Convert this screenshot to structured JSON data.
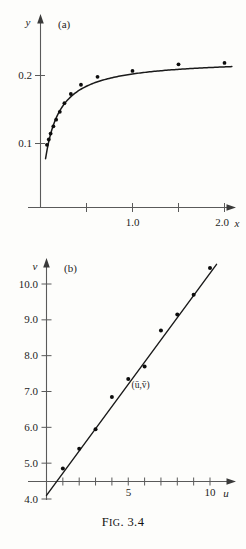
{
  "figure": {
    "caption_prefix": "F",
    "caption_smallcaps": "IG",
    "caption_rest": ". 3.4"
  },
  "panel_a": {
    "label": "(a)",
    "x_axis_label": "x",
    "y_axis_label": "y",
    "x_tick_labels": [
      "1.0",
      "2.0"
    ],
    "y_tick_labels": [
      "0.1",
      "0.2"
    ]
  },
  "panel_b": {
    "label": "(b)",
    "x_axis_label": "u",
    "y_axis_label": "v",
    "x_tick_labels": [
      "5",
      "10"
    ],
    "y_tick_labels": [
      "4.0",
      "5.0",
      "6.0",
      "7.0",
      "8.0",
      "9.0",
      "10.0"
    ],
    "annotation": "(ū,̄v̄)",
    "annotation_text": "(ū,v̄)"
  },
  "chart_data": [
    {
      "type": "scatter",
      "title": "(a)",
      "xlabel": "x",
      "ylabel": "y",
      "xlim": [
        0,
        2.15
      ],
      "ylim": [
        0,
        0.245
      ],
      "x_ticks": [
        0.5,
        1.0,
        1.5,
        2.0
      ],
      "x_ticks_labeled": [
        1.0,
        2.0
      ],
      "y_ticks": [
        0.1,
        0.2
      ],
      "grid": false,
      "legend": "none",
      "x": [
        0.07,
        0.09,
        0.11,
        0.14,
        0.17,
        0.21,
        0.26,
        0.33,
        0.44,
        0.62,
        1.0,
        1.5,
        2.0
      ],
      "y": [
        0.095,
        0.103,
        0.112,
        0.123,
        0.133,
        0.145,
        0.158,
        0.172,
        0.186,
        0.198,
        0.207,
        0.217,
        0.219
      ],
      "fit_curve": {
        "model": "saturation",
        "description": "y = x / (a + b x) rising steeply then plateauing near y = 0.22",
        "asymptote": 0.225
      }
    },
    {
      "type": "scatter",
      "title": "(b)",
      "xlabel": "u",
      "ylabel": "v",
      "xlim": [
        0,
        11.0
      ],
      "ylim": [
        4.0,
        10.6
      ],
      "x_ticks": [
        1,
        2,
        3,
        4,
        5,
        6,
        7,
        8,
        9,
        10
      ],
      "x_ticks_labeled": [
        5,
        10
      ],
      "y_ticks": [
        4.0,
        5.0,
        6.0,
        7.0,
        8.0,
        9.0,
        10.0
      ],
      "grid": false,
      "legend": "none",
      "x": [
        1,
        2,
        3,
        4,
        5,
        6,
        7,
        8,
        9,
        10
      ],
      "y": [
        4.85,
        5.4,
        5.95,
        6.85,
        7.35,
        7.7,
        8.7,
        9.15,
        9.7,
        10.45
      ],
      "fit_line": {
        "intercept": 4.1,
        "slope": 0.62,
        "x_start": 0.0,
        "x_end": 10.4
      },
      "annotations": [
        {
          "text": "(ū,v̄)",
          "x": 5.2,
          "y": 7.1
        }
      ]
    }
  ]
}
